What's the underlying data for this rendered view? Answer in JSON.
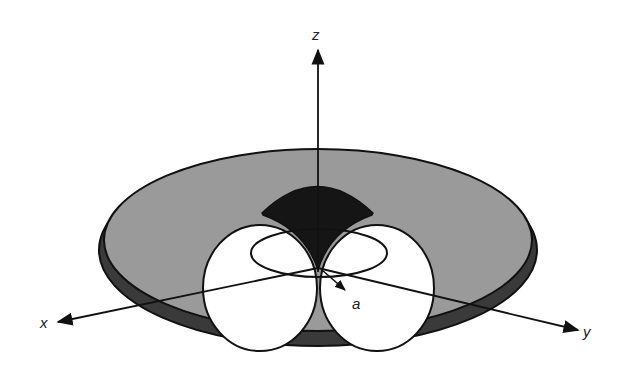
{
  "diagram": {
    "type": "3d-geometry",
    "axes": {
      "z_label": "z",
      "x_label": "x",
      "y_label": "y"
    },
    "radius_label": "a",
    "colors": {
      "background": "#ffffff",
      "disc_top": "#9a9a9a",
      "disc_rim": "#3a3a3a",
      "wedge": "#151515",
      "lobe_fill": "#ffffff",
      "stroke": "#111111"
    }
  }
}
